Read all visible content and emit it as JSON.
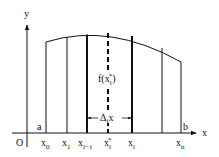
{
  "figure": {
    "type": "riemann-sum-diagram",
    "axes": {
      "x_label": "x",
      "y_label": "y",
      "origin_label": "O"
    },
    "interval": {
      "start_label": "a",
      "end_label": "b"
    },
    "partition_labels": [
      {
        "base": "x",
        "sub": "0"
      },
      {
        "base": "x",
        "sub": "1"
      },
      {
        "base": "x",
        "sub": "i−1"
      },
      {
        "base": "x",
        "sub": "i",
        "sup": "*"
      },
      {
        "base": "x",
        "sub": "i"
      },
      {
        "base": "x",
        "sub": "n"
      }
    ],
    "height_label": {
      "prefix": "f(x",
      "sub": "i",
      "sup": "*",
      "suffix": ")"
    },
    "width_label": {
      "prefix": "Δ",
      "sub": "i",
      "suffix": "x"
    },
    "colors": {
      "ink": "#111111",
      "background": "#ffffff"
    }
  }
}
